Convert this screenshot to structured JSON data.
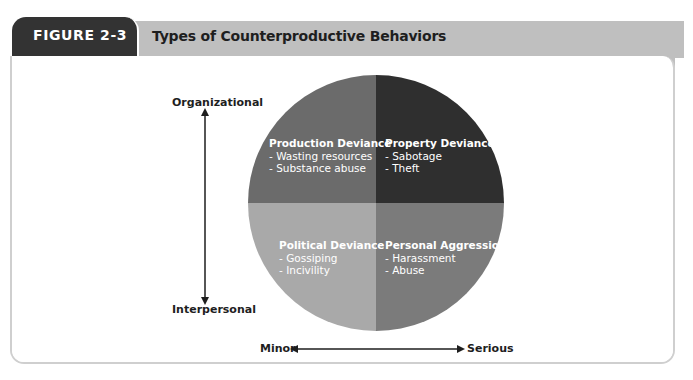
{
  "figure": {
    "label": "FIGURE 2-3",
    "title": "Types of Counterproductive Behaviors"
  },
  "axes": {
    "vertical": {
      "top_label": "Organizational",
      "bottom_label": "Interpersonal"
    },
    "horizontal": {
      "left_label": "Minor",
      "right_label": "Serious"
    }
  },
  "quadrants": [
    {
      "id": "production-deviance",
      "position": "top-left",
      "title": "Production Deviance",
      "items": [
        "- Wasting resources",
        "- Substance abuse"
      ],
      "color": "#6b6b6b"
    },
    {
      "id": "property-deviance",
      "position": "top-right",
      "title": "Property Deviance",
      "items": [
        "- Sabotage",
        "- Theft"
      ],
      "color": "#2f2f2f"
    },
    {
      "id": "political-deviance",
      "position": "bottom-left",
      "title": "Political Deviance",
      "items": [
        "- Gossiping",
        "- Incivility"
      ],
      "color": "#a9a9a9"
    },
    {
      "id": "personal-aggression",
      "position": "bottom-right",
      "title": "Personal Aggression",
      "items": [
        "- Harassment",
        "- Abuse"
      ],
      "color": "#7b7b7b"
    }
  ],
  "colors": {
    "figure_tab": "#333333",
    "title_band": "#bfbfbf",
    "panel_border": "#cfcfcf"
  }
}
